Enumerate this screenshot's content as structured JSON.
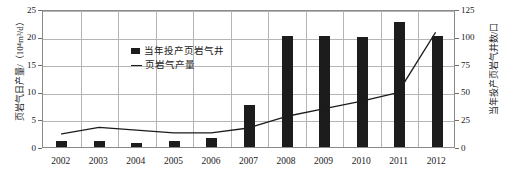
{
  "chart_data": {
    "type": "bar",
    "title": "",
    "categories": [
      "2002",
      "2003",
      "2004",
      "2005",
      "2006",
      "2007",
      "2008",
      "2009",
      "2010",
      "2011",
      "2012"
    ],
    "series": [
      {
        "name": "当年投产页岩气井",
        "type": "bar",
        "axis": "right",
        "unit": "口",
        "values": [
          5,
          5,
          4,
          5,
          8,
          38,
          101,
          101,
          100,
          113,
          101
        ]
      },
      {
        "name": "页岩气产量",
        "type": "line",
        "axis": "left",
        "unit": "10⁴m³/d",
        "values": [
          2.4,
          3.6,
          3.1,
          2.6,
          2.6,
          3.5,
          5.6,
          7.0,
          8.4,
          10.0,
          21.0
        ]
      }
    ],
    "left_axis": {
      "label": "页岩气日产量/（10⁴m³/d）",
      "ticks": [
        "0",
        "5",
        "10",
        "15",
        "20",
        "25"
      ],
      "min": 0,
      "max": 25
    },
    "right_axis": {
      "label": "当年投产页岩气井数/口",
      "ticks": [
        "0",
        "25",
        "50",
        "75",
        "100",
        "125"
      ],
      "min": 0,
      "max": 125
    },
    "xlabel": "",
    "grid": true,
    "legend_position": "top-left",
    "legend": [
      "当年投产页岩气井",
      "页岩气产量"
    ],
    "colors": {
      "bar": "#1c1c1c",
      "line": "#1c1c1c",
      "grid": "#b5b5b5",
      "frame": "#8a8a8a",
      "background": "#ffffff"
    }
  }
}
